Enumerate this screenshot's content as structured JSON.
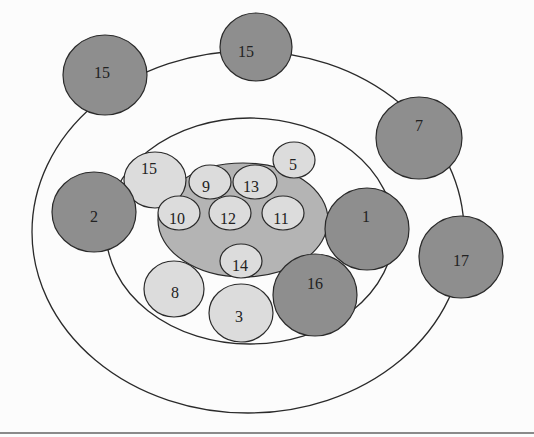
{
  "diagram": {
    "type": "nested-ellipse-node-diagram",
    "colors": {
      "background": "#fcfcfc",
      "stroke": "#2a2a2a",
      "dark_node": "#8e8e8e",
      "light_node": "#dcdcdc",
      "core_fill": "#b4b4b4",
      "rule": "#8a8a8a"
    },
    "rings": [
      {
        "id": "outer-ring",
        "cx": 248,
        "cy": 232,
        "rx": 216,
        "ry": 181
      },
      {
        "id": "middle-ring",
        "cx": 250,
        "cy": 231,
        "rx": 144,
        "ry": 113
      }
    ],
    "core": {
      "id": "core",
      "cx": 243,
      "cy": 220,
      "rx": 85,
      "ry": 57
    },
    "dark_nodes": [
      {
        "label": "15",
        "cx": 105,
        "cy": 75,
        "rx": 42,
        "ry": 40,
        "tx": 102,
        "ty": 74
      },
      {
        "label": "15",
        "cx": 256,
        "cy": 47,
        "rx": 36,
        "ry": 34,
        "tx": 246,
        "ty": 53
      },
      {
        "label": "7",
        "cx": 419,
        "cy": 138,
        "rx": 43,
        "ry": 41,
        "tx": 419,
        "ty": 127
      },
      {
        "label": "2",
        "cx": 94,
        "cy": 212,
        "rx": 42,
        "ry": 40,
        "tx": 94,
        "ty": 218
      },
      {
        "label": "1",
        "cx": 367,
        "cy": 229,
        "rx": 42,
        "ry": 41,
        "tx": 366,
        "ty": 218
      },
      {
        "label": "16",
        "cx": 315,
        "cy": 295,
        "rx": 42,
        "ry": 41,
        "tx": 315,
        "ty": 285
      },
      {
        "label": "17",
        "cx": 461,
        "cy": 257,
        "rx": 42,
        "ry": 41,
        "tx": 461,
        "ty": 262
      }
    ],
    "light_nodes": [
      {
        "label": "15",
        "cx": 155,
        "cy": 180,
        "rx": 31,
        "ry": 28,
        "tx": 149,
        "ty": 170
      },
      {
        "label": "5",
        "cx": 294,
        "cy": 160,
        "rx": 21,
        "ry": 18,
        "tx": 293,
        "ty": 166
      },
      {
        "label": "9",
        "cx": 210,
        "cy": 182,
        "rx": 21,
        "ry": 17,
        "tx": 206,
        "ty": 188
      },
      {
        "label": "13",
        "cx": 255,
        "cy": 182,
        "rx": 22,
        "ry": 17,
        "tx": 251,
        "ty": 188
      },
      {
        "label": "10",
        "cx": 179,
        "cy": 213,
        "rx": 21,
        "ry": 17,
        "tx": 177,
        "ty": 220
      },
      {
        "label": "12",
        "cx": 230,
        "cy": 213,
        "rx": 21,
        "ry": 17,
        "tx": 228,
        "ty": 220
      },
      {
        "label": "11",
        "cx": 283,
        "cy": 213,
        "rx": 21,
        "ry": 17,
        "tx": 281,
        "ty": 220
      },
      {
        "label": "14",
        "cx": 241,
        "cy": 261,
        "rx": 21,
        "ry": 17,
        "tx": 240,
        "ty": 267
      },
      {
        "label": "8",
        "cx": 174,
        "cy": 289,
        "rx": 30,
        "ry": 28,
        "tx": 175,
        "ty": 294
      },
      {
        "label": "3",
        "cx": 241,
        "cy": 313,
        "rx": 32,
        "ry": 29,
        "tx": 239,
        "ty": 318
      }
    ]
  }
}
